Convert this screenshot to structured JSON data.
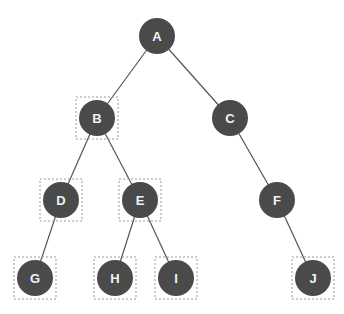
{
  "diagram": {
    "type": "binary-tree",
    "node_color": "#4a4a4a",
    "label_color": "#f2f2f2",
    "edge_color": "#555555",
    "nodes": [
      {
        "id": "A",
        "label": "A",
        "x": 157,
        "y": 36,
        "highlighted": false
      },
      {
        "id": "B",
        "label": "B",
        "x": 97,
        "y": 118,
        "highlighted": true
      },
      {
        "id": "C",
        "label": "C",
        "x": 230,
        "y": 118,
        "highlighted": false
      },
      {
        "id": "D",
        "label": "D",
        "x": 61,
        "y": 200,
        "highlighted": true
      },
      {
        "id": "E",
        "label": "E",
        "x": 140,
        "y": 200,
        "highlighted": true
      },
      {
        "id": "F",
        "label": "F",
        "x": 277,
        "y": 200,
        "highlighted": false
      },
      {
        "id": "G",
        "label": "G",
        "x": 35,
        "y": 278,
        "highlighted": true
      },
      {
        "id": "H",
        "label": "H",
        "x": 115,
        "y": 278,
        "highlighted": true
      },
      {
        "id": "I",
        "label": "I",
        "x": 176,
        "y": 278,
        "highlighted": true
      },
      {
        "id": "J",
        "label": "J",
        "x": 313,
        "y": 278,
        "highlighted": true
      }
    ],
    "edges": [
      [
        "A",
        "B"
      ],
      [
        "A",
        "C"
      ],
      [
        "B",
        "D"
      ],
      [
        "B",
        "E"
      ],
      [
        "C",
        "F"
      ],
      [
        "D",
        "G"
      ],
      [
        "E",
        "H"
      ],
      [
        "E",
        "I"
      ],
      [
        "F",
        "J"
      ]
    ]
  }
}
